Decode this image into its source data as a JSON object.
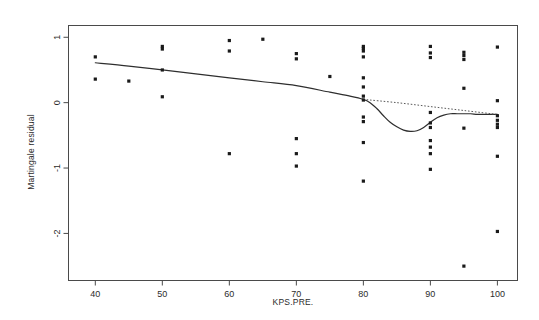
{
  "chart_data": {
    "type": "scatter",
    "title": "",
    "xlabel": "KPS.PRE.",
    "ylabel": "Martingale residual",
    "xlim": [
      36,
      103
    ],
    "ylim": [
      -2.72,
      1.18
    ],
    "grid": false,
    "legend": "none",
    "xticks": [
      40,
      50,
      60,
      70,
      80,
      90,
      100
    ],
    "yticks": [
      1,
      0,
      -1,
      -2
    ],
    "xtick_labels": [
      "40",
      "50",
      "60",
      "70",
      "80",
      "90",
      "100"
    ],
    "ytick_labels": [
      "1",
      "0",
      "-1",
      "-2"
    ],
    "points": [
      {
        "x": 40,
        "y": 0.7
      },
      {
        "x": 40,
        "y": 0.36
      },
      {
        "x": 45,
        "y": 0.33
      },
      {
        "x": 50,
        "y": 0.86
      },
      {
        "x": 50,
        "y": 0.82
      },
      {
        "x": 50,
        "y": 0.5
      },
      {
        "x": 50,
        "y": 0.09
      },
      {
        "x": 60,
        "y": 0.95
      },
      {
        "x": 60,
        "y": 0.79
      },
      {
        "x": 60,
        "y": -0.78
      },
      {
        "x": 65,
        "y": 0.97
      },
      {
        "x": 70,
        "y": 0.75
      },
      {
        "x": 70,
        "y": 0.67
      },
      {
        "x": 70,
        "y": -0.55
      },
      {
        "x": 70,
        "y": -0.78
      },
      {
        "x": 70,
        "y": -0.97
      },
      {
        "x": 75,
        "y": 0.4
      },
      {
        "x": 80,
        "y": 0.86
      },
      {
        "x": 80,
        "y": 0.83
      },
      {
        "x": 80,
        "y": 0.79
      },
      {
        "x": 80,
        "y": 0.7
      },
      {
        "x": 80,
        "y": 0.38
      },
      {
        "x": 80,
        "y": 0.24
      },
      {
        "x": 80,
        "y": 0.1
      },
      {
        "x": 80,
        "y": 0.04
      },
      {
        "x": 80,
        "y": -0.22
      },
      {
        "x": 80,
        "y": -0.29
      },
      {
        "x": 80,
        "y": -0.61
      },
      {
        "x": 80,
        "y": -1.2
      },
      {
        "x": 90,
        "y": 0.86
      },
      {
        "x": 90,
        "y": 0.76
      },
      {
        "x": 90,
        "y": 0.69
      },
      {
        "x": 90,
        "y": -0.15
      },
      {
        "x": 90,
        "y": -0.31
      },
      {
        "x": 90,
        "y": -0.38
      },
      {
        "x": 90,
        "y": -0.58
      },
      {
        "x": 90,
        "y": -0.68
      },
      {
        "x": 90,
        "y": -0.78
      },
      {
        "x": 90,
        "y": -1.02
      },
      {
        "x": 95,
        "y": 0.77
      },
      {
        "x": 95,
        "y": 0.72
      },
      {
        "x": 95,
        "y": 0.66
      },
      {
        "x": 95,
        "y": 0.22
      },
      {
        "x": 95,
        "y": -0.39
      },
      {
        "x": 95,
        "y": -2.5
      },
      {
        "x": 100,
        "y": 0.85
      },
      {
        "x": 100,
        "y": 0.03
      },
      {
        "x": 100,
        "y": -0.2
      },
      {
        "x": 100,
        "y": -0.27
      },
      {
        "x": 100,
        "y": -0.33
      },
      {
        "x": 100,
        "y": -0.38
      },
      {
        "x": 100,
        "y": -0.82
      },
      {
        "x": 100,
        "y": -1.97
      }
    ],
    "series": [
      {
        "name": "smoothed-fit",
        "style": "solid",
        "x": [
          40,
          45,
          50,
          55,
          60,
          65,
          70,
          75,
          78,
          80,
          81,
          82,
          83,
          84,
          85,
          86,
          87,
          88,
          89,
          90,
          91,
          92,
          93,
          94,
          95,
          96,
          97,
          98,
          100
        ],
        "values": [
          0.61,
          0.56,
          0.5,
          0.44,
          0.38,
          0.32,
          0.26,
          0.16,
          0.1,
          0.05,
          0.0,
          -0.09,
          -0.2,
          -0.3,
          -0.37,
          -0.42,
          -0.44,
          -0.43,
          -0.38,
          -0.3,
          -0.23,
          -0.19,
          -0.17,
          -0.17,
          -0.17,
          -0.17,
          -0.18,
          -0.18,
          -0.18
        ]
      },
      {
        "name": "linear-extension",
        "style": "dotted",
        "x": [
          80,
          85,
          90,
          95,
          100
        ],
        "values": [
          0.05,
          -0.0,
          -0.06,
          -0.12,
          -0.18
        ]
      }
    ]
  },
  "figure": {
    "x_axis_label": "KPS.PRE.",
    "y_axis_label": "Martingale residual"
  }
}
